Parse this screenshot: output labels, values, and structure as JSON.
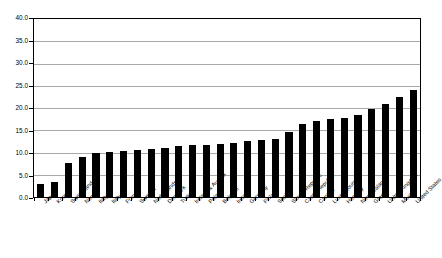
{
  "chart_data": {
    "type": "bar",
    "title": "",
    "subtitle": "",
    "xlabel": "",
    "ylabel": "",
    "ylim": [
      0.0,
      40.0
    ],
    "ytick_step": 5.0,
    "ytick_labels": [
      "0.0",
      "5.0",
      "10.0",
      "15.0",
      "20.0",
      "25.0",
      "30.0",
      "35.0",
      "40.0"
    ],
    "ytick_values": [
      0.0,
      5.0,
      10.0,
      15.0,
      20.0,
      25.0,
      30.0,
      35.0,
      40.0
    ],
    "grid": "horizontal",
    "legend": "none",
    "bar_color": "#000000",
    "gridline_color": "#a9a9a9",
    "axis_color": "#000000",
    "background_color": "#ffffff",
    "xtick_rotation": -45,
    "categories": [
      "Japan",
      "Korea",
      "Switzerland",
      "Norway",
      "Italy",
      "Italy",
      "France",
      "Sweden",
      "Netherlands",
      "Denmark",
      "Turkey",
      "Ireland & Austria",
      "Poland",
      "Belgium",
      "Ireland",
      "Germany",
      "Finland",
      "Spain",
      "Slovak Republic",
      "Czech Republic",
      "Canada",
      "Luxembourg",
      "Hungary",
      "New Zealand",
      "Greece",
      "United Kingdom",
      "Mexico",
      "United States"
    ],
    "values": [
      3.0,
      3.4,
      7.6,
      9.0,
      9.9,
      10.2,
      10.4,
      10.6,
      10.8,
      11.0,
      11.4,
      11.6,
      11.8,
      12.0,
      12.2,
      12.5,
      12.8,
      13.0,
      14.6,
      16.4,
      17.0,
      17.6,
      17.8,
      18.4,
      19.8,
      21.0,
      22.4,
      24.0
    ]
  }
}
